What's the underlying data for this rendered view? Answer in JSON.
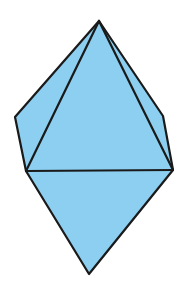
{
  "figure": {
    "type": "bipyramid-solid",
    "fill_color": "#8ccff0",
    "stroke_color": "#1a1a1a",
    "stroke_width": 2.2,
    "vertices": {
      "top": [
        99,
        21
      ],
      "left_outer": [
        15,
        117
      ],
      "left_front": [
        26,
        171
      ],
      "right_outer": [
        163,
        116
      ],
      "right_front": [
        173,
        170
      ],
      "bottom": [
        89,
        274
      ]
    }
  }
}
